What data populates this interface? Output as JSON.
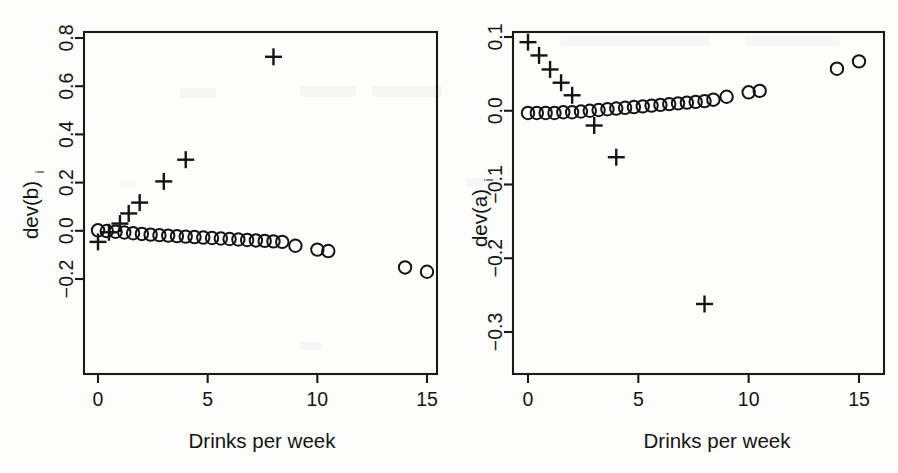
{
  "figure": {
    "name": "deviance-influence-two-panel-scatter",
    "width": 898,
    "height": 473,
    "background_color": "#fdfdfc",
    "marker_color": "#141414",
    "axis_color": "#1a1a1a"
  },
  "chart_data": [
    {
      "type": "scatter",
      "panel": "left",
      "title": "",
      "xlabel": "Drinks per week",
      "ylabel": "dev(b)",
      "ylabel_subscript": "i",
      "xlim": [
        -0.55,
        15.6
      ],
      "ylim": [
        -0.245,
        0.83
      ],
      "xticks": [
        0,
        5,
        10,
        15
      ],
      "xtick_labels": [
        "0",
        "5",
        "10",
        "15"
      ],
      "yticks": [
        -0.2,
        0.0,
        0.2,
        0.4,
        0.6,
        0.8
      ],
      "ytick_labels": [
        "-0.2",
        "0.0",
        "0.2",
        "0.4",
        "0.6",
        "0.8"
      ],
      "grid": false,
      "legend": "none",
      "series": [
        {
          "name": "circles",
          "marker": "circle",
          "points": [
            [
              0.0,
              0.002
            ],
            [
              0.4,
              -0.001
            ],
            [
              0.8,
              -0.004
            ],
            [
              1.2,
              -0.007
            ],
            [
              1.6,
              -0.01
            ],
            [
              2.0,
              -0.013
            ],
            [
              2.4,
              -0.016
            ],
            [
              2.8,
              -0.018
            ],
            [
              3.2,
              -0.02
            ],
            [
              3.6,
              -0.022
            ],
            [
              4.0,
              -0.024
            ],
            [
              4.4,
              -0.026
            ],
            [
              4.8,
              -0.028
            ],
            [
              5.2,
              -0.03
            ],
            [
              5.6,
              -0.032
            ],
            [
              6.0,
              -0.034
            ],
            [
              6.4,
              -0.036
            ],
            [
              6.8,
              -0.038
            ],
            [
              7.2,
              -0.04
            ],
            [
              7.6,
              -0.042
            ],
            [
              8.0,
              -0.044
            ],
            [
              8.4,
              -0.046
            ],
            [
              9.0,
              -0.062
            ],
            [
              10.0,
              -0.078
            ],
            [
              10.5,
              -0.084
            ],
            [
              14.0,
              -0.152
            ],
            [
              15.0,
              -0.17
            ]
          ]
        },
        {
          "name": "pluses",
          "marker": "plus",
          "points": [
            [
              0.0,
              -0.046
            ],
            [
              0.5,
              -0.006
            ],
            [
              1.0,
              0.03
            ],
            [
              1.4,
              0.072
            ],
            [
              1.9,
              0.117
            ],
            [
              3.0,
              0.205
            ],
            [
              4.0,
              0.295
            ],
            [
              8.0,
              0.722
            ]
          ]
        }
      ]
    },
    {
      "type": "scatter",
      "panel": "right",
      "title": "",
      "xlabel": "Drinks per week",
      "ylabel": "dev(a)",
      "ylabel_subscript": "i",
      "xlim": [
        -0.55,
        15.6
      ],
      "ylim": [
        -0.325,
        0.113
      ],
      "xticks": [
        0,
        5,
        10,
        15
      ],
      "xtick_labels": [
        "0",
        "5",
        "10",
        "15"
      ],
      "yticks": [
        -0.3,
        -0.2,
        -0.1,
        0.0,
        0.1
      ],
      "ytick_labels": [
        "-0.3",
        "-0.2",
        "-0.1",
        "0.0",
        "0.1"
      ],
      "grid": false,
      "legend": "none",
      "series": [
        {
          "name": "circles",
          "marker": "circle",
          "points": [
            [
              0.0,
              -0.003
            ],
            [
              0.4,
              -0.003
            ],
            [
              0.8,
              -0.003
            ],
            [
              1.2,
              -0.003
            ],
            [
              1.6,
              -0.002
            ],
            [
              2.0,
              -0.002
            ],
            [
              2.4,
              -0.001
            ],
            [
              2.8,
              0.0
            ],
            [
              3.2,
              0.001
            ],
            [
              3.6,
              0.002
            ],
            [
              4.0,
              0.003
            ],
            [
              4.4,
              0.004
            ],
            [
              4.8,
              0.005
            ],
            [
              5.2,
              0.006
            ],
            [
              5.6,
              0.007
            ],
            [
              6.0,
              0.008
            ],
            [
              6.4,
              0.009
            ],
            [
              6.8,
              0.01
            ],
            [
              7.2,
              0.011
            ],
            [
              7.6,
              0.012
            ],
            [
              8.0,
              0.013
            ],
            [
              8.4,
              0.015
            ],
            [
              9.0,
              0.019
            ],
            [
              10.0,
              0.025
            ],
            [
              10.5,
              0.027
            ],
            [
              14.0,
              0.057
            ],
            [
              15.0,
              0.067
            ]
          ]
        },
        {
          "name": "pluses",
          "marker": "plus",
          "points": [
            [
              0.0,
              0.093
            ],
            [
              0.5,
              0.075
            ],
            [
              1.0,
              0.056
            ],
            [
              1.5,
              0.038
            ],
            [
              2.0,
              0.021
            ],
            [
              3.0,
              -0.02
            ],
            [
              4.0,
              -0.063
            ],
            [
              8.0,
              -0.262
            ]
          ]
        }
      ]
    }
  ]
}
